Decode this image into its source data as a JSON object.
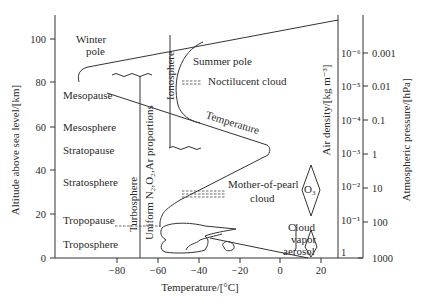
{
  "axes": {
    "y_label": "Altitude above sea level/[km]",
    "x_label": "Temperature/[°C]",
    "density_label": "Air density/[kg m⁻³]",
    "pressure_label": "Atmospheric pressure/[hPa]",
    "y_ticks": [
      "0",
      "20",
      "40",
      "60",
      "80",
      "100"
    ],
    "x_ticks": [
      "−80",
      "−60",
      "−40",
      "−20",
      "0",
      "20"
    ],
    "density_ticks": [
      "10⁻⁶",
      "10⁻⁵",
      "10⁻⁴",
      "10⁻³",
      "10⁻²",
      "10⁻¹",
      "1"
    ],
    "pressure_ticks": [
      "0.001",
      "0.01",
      "0.1",
      "1",
      "10",
      "100",
      "1000"
    ]
  },
  "layers": {
    "winter_pole_1": "Winter",
    "winter_pole_2": "pole",
    "summer_pole": "Summer pole",
    "mesopause": "Mesopause",
    "mesosphere": "Mesosphere",
    "stratopause": "Stratopause",
    "stratosphere": "Stratosphere",
    "tropopause": "Tropopause",
    "troposphere": "Troposphere"
  },
  "annotations": {
    "ionosphere": "Ionosphere",
    "noctilucent": "Noctilucent cloud",
    "temperature": "Temperature",
    "turbosphere": "Turbosphere",
    "uniform": "Uniform N₂,O₂,Ar proportions",
    "mother_of_pearl_1": "Mother-of-pearl",
    "mother_of_pearl_2": "cloud",
    "ozone": "O₃",
    "cloud": "Cloud",
    "vapor": "vapor",
    "aerosol": "aerosol"
  }
}
